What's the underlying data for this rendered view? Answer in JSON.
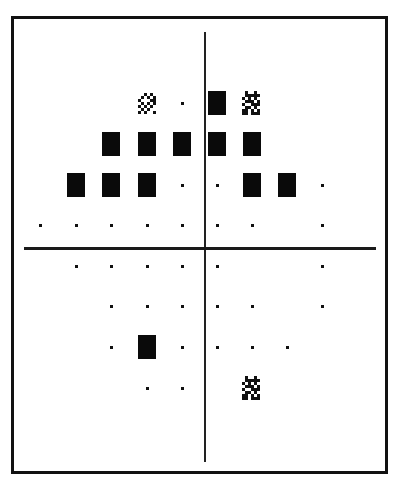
{
  "chart_data": {
    "type": "heatmap",
    "title": "",
    "columns_x_px": [
      40,
      76,
      111,
      147,
      182,
      217,
      252,
      287,
      322
    ],
    "rows_y_px": [
      103,
      144,
      185,
      225,
      266,
      306,
      347,
      388
    ],
    "legend": {
      "dot": "normal / not significant",
      "four-dot": "p < 5%",
      "diagonal-hatch": "p < 2%",
      "checker": "p < 1%",
      "solid": "p < 0.5%"
    },
    "points": [
      {
        "row": 1,
        "col": 4,
        "symbol": "diagonal-hatch"
      },
      {
        "row": 1,
        "col": 5,
        "symbol": "dot"
      },
      {
        "row": 1,
        "col": 6,
        "symbol": "solid"
      },
      {
        "row": 1,
        "col": 7,
        "symbol": "checker"
      },
      {
        "row": 2,
        "col": 3,
        "symbol": "solid"
      },
      {
        "row": 2,
        "col": 4,
        "symbol": "solid"
      },
      {
        "row": 2,
        "col": 5,
        "symbol": "solid"
      },
      {
        "row": 2,
        "col": 6,
        "symbol": "solid"
      },
      {
        "row": 2,
        "col": 7,
        "symbol": "solid"
      },
      {
        "row": 2,
        "col": 8,
        "symbol": "four-dot"
      },
      {
        "row": 3,
        "col": 2,
        "symbol": "solid"
      },
      {
        "row": 3,
        "col": 3,
        "symbol": "solid"
      },
      {
        "row": 3,
        "col": 4,
        "symbol": "solid"
      },
      {
        "row": 3,
        "col": 5,
        "symbol": "dot"
      },
      {
        "row": 3,
        "col": 6,
        "symbol": "dot"
      },
      {
        "row": 3,
        "col": 7,
        "symbol": "solid"
      },
      {
        "row": 3,
        "col": 8,
        "symbol": "solid"
      },
      {
        "row": 3,
        "col": 9,
        "symbol": "dot"
      },
      {
        "row": 4,
        "col": 1,
        "symbol": "dot"
      },
      {
        "row": 4,
        "col": 2,
        "symbol": "dot"
      },
      {
        "row": 4,
        "col": 3,
        "symbol": "dot"
      },
      {
        "row": 4,
        "col": 4,
        "symbol": "dot"
      },
      {
        "row": 4,
        "col": 5,
        "symbol": "dot"
      },
      {
        "row": 4,
        "col": 6,
        "symbol": "dot"
      },
      {
        "row": 4,
        "col": 7,
        "symbol": "dot"
      },
      {
        "row": 4,
        "col": 9,
        "symbol": "dot"
      },
      {
        "row": 5,
        "col": 1,
        "symbol": "four-dot"
      },
      {
        "row": 5,
        "col": 2,
        "symbol": "dot"
      },
      {
        "row": 5,
        "col": 3,
        "symbol": "dot"
      },
      {
        "row": 5,
        "col": 4,
        "symbol": "dot"
      },
      {
        "row": 5,
        "col": 5,
        "symbol": "dot"
      },
      {
        "row": 5,
        "col": 6,
        "symbol": "dot"
      },
      {
        "row": 5,
        "col": 7,
        "symbol": "four-dot"
      },
      {
        "row": 5,
        "col": 9,
        "symbol": "dot"
      },
      {
        "row": 6,
        "col": 2,
        "symbol": "four-dot"
      },
      {
        "row": 6,
        "col": 3,
        "symbol": "dot"
      },
      {
        "row": 6,
        "col": 4,
        "symbol": "dot"
      },
      {
        "row": 6,
        "col": 5,
        "symbol": "dot"
      },
      {
        "row": 6,
        "col": 6,
        "symbol": "dot"
      },
      {
        "row": 6,
        "col": 7,
        "symbol": "dot"
      },
      {
        "row": 6,
        "col": 8,
        "symbol": "four-dot"
      },
      {
        "row": 6,
        "col": 9,
        "symbol": "dot"
      },
      {
        "row": 7,
        "col": 3,
        "symbol": "dot"
      },
      {
        "row": 7,
        "col": 4,
        "symbol": "solid"
      },
      {
        "row": 7,
        "col": 5,
        "symbol": "dot"
      },
      {
        "row": 7,
        "col": 6,
        "symbol": "dot"
      },
      {
        "row": 7,
        "col": 7,
        "symbol": "dot"
      },
      {
        "row": 7,
        "col": 8,
        "symbol": "dot"
      },
      {
        "row": 8,
        "col": 4,
        "symbol": "dot"
      },
      {
        "row": 8,
        "col": 5,
        "symbol": "dot"
      },
      {
        "row": 8,
        "col": 6,
        "symbol": "four-dot"
      },
      {
        "row": 8,
        "col": 7,
        "symbol": "checker"
      }
    ],
    "axes": {
      "vertical_line": true,
      "horizontal_line": true,
      "tick_labels": []
    },
    "colors": {
      "foreground": "#111111",
      "background": "#ffffff"
    }
  }
}
